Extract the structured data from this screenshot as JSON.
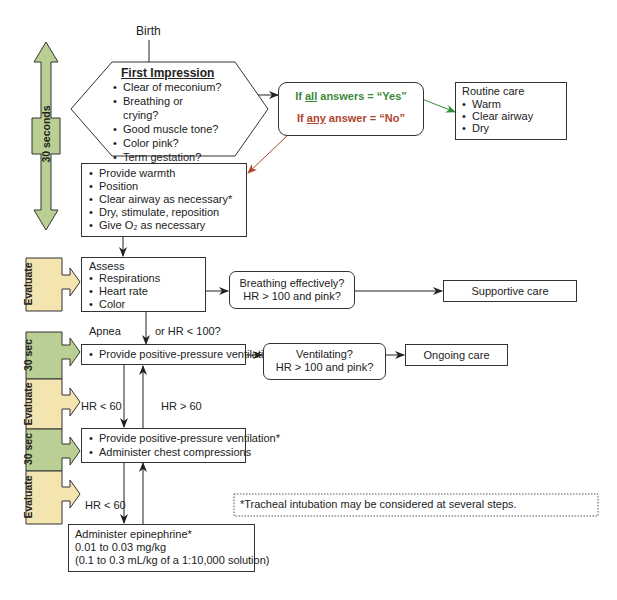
{
  "start_label": "Birth",
  "first_impression": {
    "title": "First Impression",
    "items": [
      "Clear of meconium?",
      "Breathing or",
      "crying?",
      "Good muscle tone?",
      "Color pink?",
      "Term gestation?"
    ]
  },
  "decision": {
    "yes_prefix": "If ",
    "yes_key": "all",
    "yes_suffix": " answers = “Yes”",
    "no_prefix": "If ",
    "no_key": "any",
    "no_suffix": " answer = “No”",
    "yes_color": "#3a8a3a",
    "no_color": "#b0442e"
  },
  "routine_care": {
    "title": "Routine care",
    "items": [
      "Warm",
      "Clear airway",
      "Dry"
    ]
  },
  "initial_steps": {
    "items": [
      "Provide warmth",
      "Position",
      "Clear airway as necessary*",
      "Dry, stimulate, reposition",
      "Give O₂ as necessary"
    ]
  },
  "assess": {
    "title": "Assess",
    "items": [
      "Respirations",
      "Heart rate",
      "Color"
    ]
  },
  "breathing_check": {
    "line1": "Breathing effectively?",
    "line2": "HR > 100 and pink?"
  },
  "supportive_care": "Supportive care",
  "apnea_label_left": "Apnea",
  "apnea_label_right": "or HR < 100?",
  "ppv": {
    "items": [
      "Provide positive-pressure ventilation*"
    ]
  },
  "ventilating_check": {
    "line1": "Ventilating?",
    "line2": "HR > 100 and pink?"
  },
  "ongoing_care": "Ongoing care",
  "hr_lt_60_a": "HR < 60",
  "hr_gt_60": "HR > 60",
  "ppv_compressions": {
    "items": [
      "Provide positive-pressure ventilation*",
      "Administer chest compressions"
    ]
  },
  "hr_lt_60_b": "HR < 60",
  "epinephrine": {
    "line1": "Administer epinephrine*",
    "line2": "0.01 to 0.03 mg/kg",
    "line3": "(0.1 to 0.3 mL/kg of a 1:10,000 solution)"
  },
  "footnote": "*Tracheal intubation may be considered at several steps.",
  "sidebar": {
    "timer_label": "30 seconds",
    "stages": [
      {
        "label": "Evaluate",
        "color": "#f3e4b0"
      },
      {
        "label": "30 sec",
        "color": "#b9cf93"
      },
      {
        "label": "Evaluate",
        "color": "#f3e4b0"
      },
      {
        "label": "30 sec",
        "color": "#b9cf93"
      },
      {
        "label": "Evaluate",
        "color": "#f3e4b0"
      }
    ],
    "green": "#b9cf93",
    "tan": "#f3e4b0"
  }
}
